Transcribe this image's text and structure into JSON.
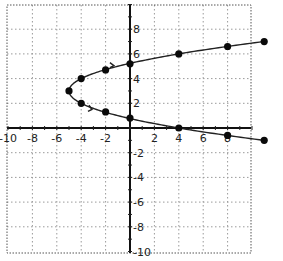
{
  "chart_data": {
    "type": "scatter",
    "title": "",
    "xlabel": "",
    "ylabel": "",
    "xlim": [
      -10,
      10
    ],
    "ylim": [
      -10,
      10
    ],
    "grid": true,
    "grid_step": 2,
    "x_tick_labels": [
      "-10",
      "-8",
      "-6",
      "-4",
      "-2",
      "2",
      "4",
      "6",
      "8"
    ],
    "y_tick_labels": [
      "8",
      "6",
      "4",
      "2",
      "-2",
      "-4",
      "-6",
      "-8",
      "-10"
    ],
    "equation_implied": "x = (y - 3)^2 - 5",
    "vertex": {
      "x": -5,
      "y": 3
    },
    "series": [
      {
        "name": "upper branch",
        "points": [
          {
            "x": -5,
            "y": 3
          },
          {
            "x": -4,
            "y": 4
          },
          {
            "x": -2,
            "y": 4.7
          },
          {
            "x": 0,
            "y": 5.2
          },
          {
            "x": 4,
            "y": 6
          },
          {
            "x": 8,
            "y": 6.6
          },
          {
            "x": 11,
            "y": 7
          }
        ]
      },
      {
        "name": "lower branch",
        "points": [
          {
            "x": -5,
            "y": 3
          },
          {
            "x": -4,
            "y": 2
          },
          {
            "x": -2,
            "y": 1.3
          },
          {
            "x": 0,
            "y": 0.8
          },
          {
            "x": 4,
            "y": 0
          },
          {
            "x": 8,
            "y": -0.6
          },
          {
            "x": 11,
            "y": -1
          }
        ]
      }
    ],
    "legend": null
  }
}
